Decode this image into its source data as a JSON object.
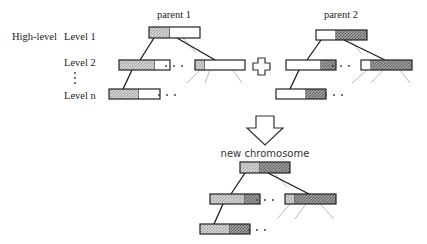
{
  "labels": {
    "high_level": "High-level",
    "level_1": "Level 1",
    "level_2": "Level 2",
    "vertical_ellipsis": "⋮",
    "level_n": "Level n",
    "parent_1": "parent 1",
    "parent_2": "parent 2",
    "new_chromosome": "new chromosome",
    "ellipsis": "· · ·"
  },
  "colors": {
    "light_hatch": "#c9c9c9",
    "dark_hatch": "#8f8f8f",
    "white": "#ffffff",
    "outline": "#222222",
    "light_edge": "#bbbbbb"
  },
  "trees": [
    {
      "id": "parent-1",
      "title_key": "parent_1",
      "title_pos": [
        174,
        18
      ],
      "boxes": [
        {
          "name": "root",
          "x": 149,
          "y": 27,
          "w": 51,
          "h": 11,
          "segments": [
            {
              "w": 21,
              "fill": "light"
            },
            {
              "w": 30,
              "fill": "white"
            }
          ]
        },
        {
          "name": "level-2-left",
          "x": 119,
          "y": 60,
          "w": 51,
          "h": 10,
          "segments": [
            {
              "w": 36,
              "fill": "light"
            },
            {
              "w": 15,
              "fill": "white"
            }
          ]
        },
        {
          "name": "level-2-right",
          "x": 195,
          "y": 60,
          "w": 50,
          "h": 10,
          "segments": [
            {
              "w": 10,
              "fill": "light"
            },
            {
              "w": 40,
              "fill": "white"
            }
          ]
        },
        {
          "name": "level-n",
          "x": 109,
          "y": 89,
          "w": 51,
          "h": 10,
          "segments": [
            {
              "w": 30,
              "fill": "light"
            },
            {
              "w": 21,
              "fill": "white"
            }
          ]
        }
      ],
      "edges_dark": [
        [
          154,
          38,
          140,
          60
        ],
        [
          177,
          38,
          215,
          60
        ],
        [
          132,
          70,
          123,
          89
        ]
      ],
      "edges_light": [
        [
          183,
          38,
          196,
          53
        ],
        [
          200,
          70,
          187,
          83
        ],
        [
          210,
          70,
          205,
          83
        ],
        [
          233,
          70,
          242,
          83
        ]
      ],
      "ellipses": [
        [
          174,
          66
        ],
        [
          167,
          95
        ]
      ]
    },
    {
      "id": "parent-2",
      "title_key": "parent_2",
      "title_pos": [
        341,
        18
      ],
      "boxes": [
        {
          "name": "root",
          "x": 316,
          "y": 30,
          "w": 51,
          "h": 10,
          "segments": [
            {
              "w": 20,
              "fill": "white"
            },
            {
              "w": 31,
              "fill": "dark"
            }
          ]
        },
        {
          "name": "level-2-left",
          "x": 286,
          "y": 60,
          "w": 50,
          "h": 10,
          "segments": [
            {
              "w": 35,
              "fill": "white"
            },
            {
              "w": 15,
              "fill": "dark"
            }
          ]
        },
        {
          "name": "level-2-right",
          "x": 361,
          "y": 60,
          "w": 51,
          "h": 10,
          "segments": [
            {
              "w": 10,
              "fill": "white"
            },
            {
              "w": 41,
              "fill": "dark"
            }
          ]
        },
        {
          "name": "level-n",
          "x": 276,
          "y": 89,
          "w": 50,
          "h": 10,
          "segments": [
            {
              "w": 30,
              "fill": "white"
            },
            {
              "w": 20,
              "fill": "dark"
            }
          ]
        }
      ],
      "edges_dark": [
        [
          321,
          40,
          307,
          60
        ],
        [
          344,
          40,
          385,
          60
        ],
        [
          299,
          70,
          290,
          89
        ]
      ],
      "edges_light": [
        [
          350,
          40,
          361,
          53
        ],
        [
          367,
          70,
          352,
          83
        ],
        [
          383,
          70,
          371,
          83
        ],
        [
          400,
          70,
          410,
          83
        ]
      ],
      "ellipses": [
        [
          341,
          66
        ],
        [
          334,
          95
        ]
      ]
    },
    {
      "id": "new-chromosome",
      "title_key": "new_chromosome",
      "title_pos": [
        265,
        157
      ],
      "boxes": [
        {
          "name": "root",
          "x": 240,
          "y": 162,
          "w": 50,
          "h": 11,
          "segments": [
            {
              "w": 20,
              "fill": "light"
            },
            {
              "w": 30,
              "fill": "dark"
            }
          ]
        },
        {
          "name": "level-2-left",
          "x": 210,
          "y": 194,
          "w": 50,
          "h": 10,
          "segments": [
            {
              "w": 35,
              "fill": "light"
            },
            {
              "w": 15,
              "fill": "dark"
            }
          ]
        },
        {
          "name": "level-2-right",
          "x": 285,
          "y": 194,
          "w": 51,
          "h": 10,
          "segments": [
            {
              "w": 10,
              "fill": "light"
            },
            {
              "w": 41,
              "fill": "dark"
            }
          ]
        },
        {
          "name": "level-n",
          "x": 200,
          "y": 224,
          "w": 50,
          "h": 10,
          "segments": [
            {
              "w": 30,
              "fill": "light"
            },
            {
              "w": 20,
              "fill": "dark"
            }
          ]
        }
      ],
      "edges_dark": [
        [
          245,
          173,
          231,
          194
        ],
        [
          268,
          173,
          309,
          194
        ],
        [
          223,
          204,
          214,
          224
        ]
      ],
      "edges_light": [
        [
          274,
          173,
          287,
          187
        ],
        [
          290,
          204,
          277,
          219
        ],
        [
          306,
          204,
          295,
          219
        ],
        [
          320,
          204,
          334,
          219
        ]
      ],
      "ellipses": [
        [
          265,
          200
        ],
        [
          257,
          230
        ]
      ]
    }
  ],
  "operators": {
    "plus": {
      "symbol": "plus",
      "cx": 262,
      "cy": 66
    },
    "arrow": {
      "symbol": "down-arrow",
      "cx": 265,
      "top": 116,
      "bottom": 145
    }
  }
}
